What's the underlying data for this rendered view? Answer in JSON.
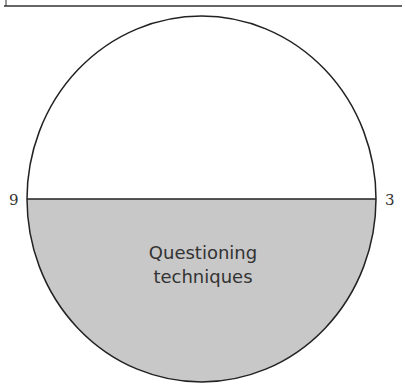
{
  "diagram": {
    "clock_labels": {
      "left": "9",
      "right": "3"
    },
    "segment": {
      "line1": "Questioning",
      "line2": "techniques"
    },
    "colors": {
      "fill": "#c8c8c8",
      "stroke": "#222222",
      "background": "#ffffff"
    }
  }
}
